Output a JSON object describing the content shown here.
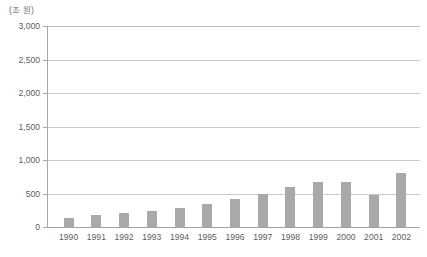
{
  "chart_data": {
    "type": "bar",
    "title": "",
    "subtitle": "",
    "unit_label": "(조 원)",
    "xlabel": "",
    "ylabel": "",
    "categories": [
      "1990",
      "1991",
      "1992",
      "1993",
      "1994",
      "1995",
      "1996",
      "1997",
      "1998",
      "1999",
      "2000",
      "2001",
      "2002"
    ],
    "values": [
      135,
      180,
      210,
      240,
      290,
      340,
      420,
      490,
      600,
      670,
      670,
      475,
      810
    ],
    "series": [
      {
        "name": "",
        "values": [
          135,
          180,
          210,
          240,
          290,
          340,
          420,
          490,
          600,
          670,
          670,
          475,
          810
        ]
      }
    ],
    "ylim": [
      0,
      3000
    ],
    "ytick_values": [
      0,
      500,
      1000,
      1500,
      2000,
      2500,
      3000
    ],
    "ytick_labels": [
      "0",
      "500",
      "1,000",
      "1,500",
      "2,000",
      "2,500",
      "3,000"
    ],
    "grid": true,
    "grid_axis": "y",
    "legend": false,
    "legend_position": "none",
    "bar_color": "#a9a9a9",
    "grid_color": "#c9c9c9",
    "axis_color": "#a8a8a8",
    "text_color": "#5d5d5d",
    "background_color": "#ffffff"
  }
}
